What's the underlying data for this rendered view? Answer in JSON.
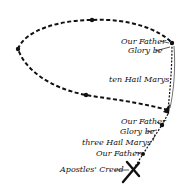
{
  "diagram": {
    "colors": {
      "ink": "#111111",
      "background": "#ffffff"
    },
    "labels": [
      {
        "text": "Our Father",
        "x": 121,
        "y": 38
      },
      {
        "text": "Glory be",
        "x": 128,
        "y": 47
      },
      {
        "text": "ten Hail Marys",
        "x": 109,
        "y": 76
      },
      {
        "text": "Our Father",
        "x": 121,
        "y": 118
      },
      {
        "text": "Glory be",
        "x": 120,
        "y": 128
      },
      {
        "text": "three Hail Marys",
        "x": 82,
        "y": 139
      },
      {
        "text": "Our Father",
        "x": 96,
        "y": 150
      },
      {
        "text": "Apostles' Creed",
        "x": 60,
        "y": 168
      }
    ],
    "beads": [
      {
        "name": "loop-top-bead",
        "x": 92,
        "y": 20
      },
      {
        "name": "loop-left-bead",
        "x": 18,
        "y": 49
      },
      {
        "name": "loop-bottom-bead",
        "x": 86,
        "y": 95
      },
      {
        "name": "our-father-bead-top-right",
        "x": 172,
        "y": 43
      },
      {
        "name": "our-father-bead-pendant-1",
        "x": 162,
        "y": 125
      },
      {
        "name": "our-father-bead-pendant-2",
        "x": 143,
        "y": 154
      }
    ],
    "cross": {
      "label": "cross",
      "x": 133,
      "y": 170
    }
  }
}
